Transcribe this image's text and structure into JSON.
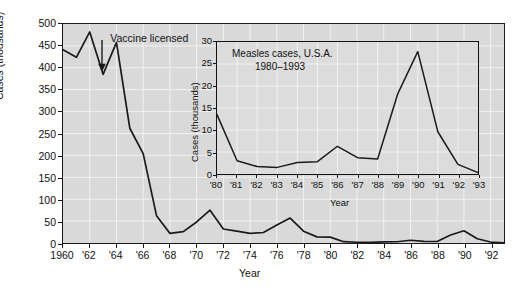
{
  "chart_data": [
    {
      "id": "main",
      "type": "line",
      "title": "",
      "xlabel": "Year",
      "ylabel": "Cases (thousands)",
      "xlim": [
        1960,
        1993
      ],
      "ylim": [
        0,
        500
      ],
      "yticks": [
        0,
        50,
        100,
        150,
        200,
        250,
        300,
        350,
        400,
        450,
        500
      ],
      "yticklabels": [
        "0",
        "50",
        "100",
        "150",
        "200",
        "250",
        "300",
        "350",
        "400",
        "450",
        "500"
      ],
      "xticks": [
        1960,
        1962,
        1964,
        1966,
        1968,
        1970,
        1972,
        1974,
        1976,
        1978,
        1980,
        1982,
        1984,
        1986,
        1988,
        1990,
        1992
      ],
      "xticklabels": [
        "1960",
        "'62",
        "'64",
        "'66",
        "'68",
        "'70",
        "'72",
        "'74",
        "'76",
        "'78",
        "'80",
        "'82",
        "'84",
        "'86",
        "'88",
        "'90",
        "'92"
      ],
      "grid": true,
      "x": [
        1960,
        1961,
        1962,
        1963,
        1964,
        1965,
        1966,
        1967,
        1968,
        1969,
        1970,
        1971,
        1972,
        1973,
        1974,
        1975,
        1976,
        1977,
        1978,
        1979,
        1980,
        1981,
        1982,
        1983,
        1984,
        1985,
        1986,
        1987,
        1988,
        1989,
        1990,
        1991,
        1992,
        1993
      ],
      "values": [
        441,
        424,
        482,
        385,
        458,
        262,
        204,
        62,
        22,
        26,
        48,
        75,
        32,
        27,
        22,
        24,
        41,
        57,
        27,
        14,
        13.5,
        3,
        1.7,
        1.5,
        2.6,
        2.8,
        6.3,
        3.7,
        3.4,
        18.2,
        27.8,
        9.6,
        2.2,
        0.3
      ],
      "annotations": [
        {
          "text": "Vaccine licensed",
          "x": 1963,
          "y": 385
        }
      ]
    },
    {
      "id": "inset",
      "type": "line",
      "title": "Measles cases, U.S.A.",
      "subtitle": "1980–1993",
      "xlabel": "Year",
      "ylabel": "Cases (thousands)",
      "xlim": [
        1980,
        1993
      ],
      "ylim": [
        0,
        30
      ],
      "yticks": [
        0,
        5,
        10,
        15,
        20,
        25,
        30
      ],
      "yticklabels": [
        "0",
        "5",
        "10",
        "15",
        "20",
        "25",
        "30"
      ],
      "xticks": [
        1980,
        1981,
        1982,
        1983,
        1984,
        1985,
        1986,
        1987,
        1988,
        1989,
        1990,
        1991,
        1992,
        1993
      ],
      "xticklabels": [
        "'80",
        "'81",
        "'82",
        "'83",
        "'84",
        "'85",
        "'86",
        "'87",
        "'88",
        "'89",
        "'90",
        "'91",
        "'92",
        "'93"
      ],
      "grid": true,
      "x": [
        1980,
        1981,
        1982,
        1983,
        1984,
        1985,
        1986,
        1987,
        1988,
        1989,
        1990,
        1991,
        1992,
        1993
      ],
      "values": [
        13.5,
        3.0,
        1.7,
        1.5,
        2.6,
        2.8,
        6.3,
        3.7,
        3.4,
        18.2,
        27.8,
        9.6,
        2.2,
        0.3
      ]
    }
  ],
  "main": {
    "ylabel": "Cases (thousands)",
    "xlabel": "Year",
    "annotation": "Vaccine licensed"
  },
  "inset": {
    "title_line1": "Measles cases, U.S.A.",
    "title_line2": "1980–1993",
    "ylabel": "Cases (thousands)",
    "xlabel": "Year"
  },
  "colors": {
    "plot_background": "#d9d9d9",
    "inset_background": "#dcdcdc",
    "line": "#1a1a1a",
    "grid": "#f2f2f2",
    "text": "#111111",
    "page_background": "#ffffff"
  }
}
